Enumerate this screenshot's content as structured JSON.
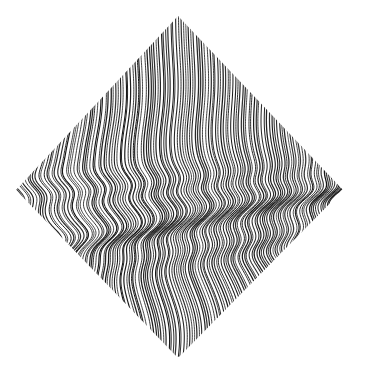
{
  "canvas": {
    "width": 365,
    "height": 374,
    "background_color": "#ffffff",
    "title": "Op-art diamond of wavy vertical lines"
  },
  "artwork": {
    "name": "diamond-wave-lines",
    "medium": "generative line art",
    "stroke_color": "#111111",
    "stroke_width": 1.05,
    "line_count": 132,
    "line_pitch_px": 2.52,
    "shape": "diamond",
    "shape_vertices": {
      "top": [
        178,
        16
      ],
      "left": [
        16,
        190
      ],
      "right": [
        343,
        190
      ],
      "bottom": [
        178,
        358
      ]
    },
    "edge_jitter_px": 1.6,
    "sample_step_px": 1.6,
    "description": "A rotated square (diamond) densely filled with near-vertical black lines that are horizontally displaced by superposed sine waves, producing moire ripple bands across the middle."
  },
  "chart_data": {
    "type": "line",
    "xlabel": "",
    "ylabel": "",
    "xlim": [
      16,
      343
    ],
    "ylim": [
      16,
      358
    ],
    "grid": false,
    "legend": "none",
    "series_count": 132,
    "clip_polygon": [
      [
        178,
        16
      ],
      [
        343,
        190
      ],
      [
        178,
        358
      ],
      [
        16,
        190
      ]
    ],
    "line_geometry": {
      "base_x_start": 16,
      "base_x_end": 343,
      "y_start": 16,
      "y_end": 358,
      "displacement_model": "sum_of_sines",
      "waves": [
        {
          "name": "primary-s-wave",
          "amplitude": 13.5,
          "wavelength_y": 168,
          "phase_y": 214,
          "x_phase_gain": 0.0135,
          "envelope_center_y": 224,
          "envelope_sigma_y": 74
        },
        {
          "name": "ripple-band-upper",
          "amplitude": 5.2,
          "wavelength_y": 46,
          "phase_y": 190,
          "x_phase_gain": 0.027,
          "envelope_center_y": 191,
          "envelope_sigma_y": 20
        },
        {
          "name": "ripple-band-lower",
          "amplitude": 6.4,
          "wavelength_y": 52,
          "phase_y": 236,
          "x_phase_gain": 0.031,
          "envelope_center_y": 236,
          "envelope_sigma_y": 24
        },
        {
          "name": "bottom-fan",
          "amplitude": 9.0,
          "wavelength_y": 420,
          "phase_y": 300,
          "x_phase_gain": 0.0042,
          "envelope_center_y": 318,
          "envelope_sigma_y": 70
        },
        {
          "name": "top-drift",
          "amplitude": 2.6,
          "wavelength_y": 260,
          "phase_y": 70,
          "x_phase_gain": 0.006,
          "envelope_center_y": 90,
          "envelope_sigma_y": 62
        }
      ]
    }
  }
}
